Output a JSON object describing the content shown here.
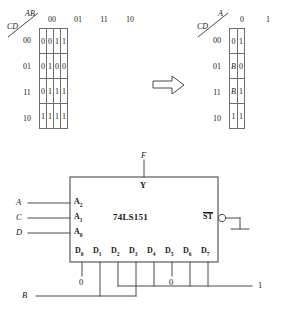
{
  "figure": {
    "kmap_left": {
      "name": "karnaugh-map-4var",
      "col_var": "AB",
      "row_var": "CD",
      "col_headers": [
        "00",
        "01",
        "11",
        "10"
      ],
      "row_headers": [
        "00",
        "01",
        "11",
        "10"
      ],
      "rows": [
        [
          "0",
          "0",
          "1",
          "1"
        ],
        [
          "0",
          "1",
          "0",
          "0"
        ],
        [
          "0",
          "1",
          "1",
          "1"
        ],
        [
          "1",
          "1",
          "1",
          "1"
        ]
      ]
    },
    "transform_arrow": "⇒",
    "kmap_right": {
      "name": "karnaugh-map-reduced",
      "col_var": "A",
      "row_var": "CD",
      "col_headers": [
        "0",
        "1"
      ],
      "row_headers": [
        "00",
        "01",
        "11",
        "10"
      ],
      "rows": [
        [
          "0",
          "1"
        ],
        [
          "B",
          "0"
        ],
        [
          "B",
          "1"
        ],
        [
          "1",
          "1"
        ]
      ],
      "italic_cells": [
        "1:0",
        "2:0"
      ]
    },
    "circuit": {
      "chip_label": "74LS151",
      "output_signal": "F",
      "output_pin": "Y",
      "strobe_pin": "ST",
      "strobe_overline": true,
      "address_inputs": [
        {
          "signal": "A",
          "pin": "A",
          "sub": "2"
        },
        {
          "signal": "C",
          "pin": "A",
          "sub": "1"
        },
        {
          "signal": "D",
          "pin": "A",
          "sub": "0"
        }
      ],
      "data_pins": [
        {
          "pin": "D",
          "sub": "0"
        },
        {
          "pin": "D",
          "sub": "1"
        },
        {
          "pin": "D",
          "sub": "2"
        },
        {
          "pin": "D",
          "sub": "3"
        },
        {
          "pin": "D",
          "sub": "4"
        },
        {
          "pin": "D",
          "sub": "5"
        },
        {
          "pin": "D",
          "sub": "6"
        },
        {
          "pin": "D",
          "sub": "7"
        }
      ],
      "constant_low_left": "0",
      "constant_low_right": "0",
      "bus_one_label": "1",
      "bus_b_label": "B"
    }
  }
}
